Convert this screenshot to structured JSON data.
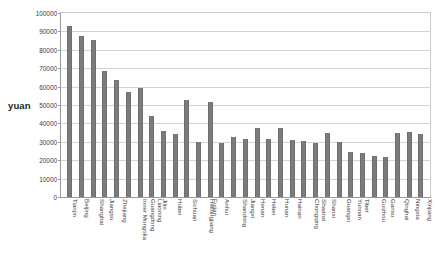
{
  "axis": {
    "y_unit_label": "yuan"
  },
  "chart_data": {
    "type": "bar",
    "title": "",
    "subtitle": "",
    "xlabel": "",
    "ylabel": "yuan",
    "ylim": [
      0,
      100000
    ],
    "ytick_labels": [
      "100000",
      "90000",
      "80000",
      "70000",
      "60000",
      "50000",
      "40000",
      "30000",
      "20000",
      "10000",
      "0"
    ],
    "ytick_values": [
      100000,
      90000,
      80000,
      70000,
      60000,
      50000,
      40000,
      30000,
      20000,
      10000,
      0
    ],
    "grid": true,
    "legend": "none",
    "bar_color": "#7b7b7b",
    "categories": [
      "Tianjin",
      "Beijing",
      "Shanghai",
      "Jiangsu",
      "Zhejiang",
      "Inner Mongolia",
      "Guangdong",
      "Liaoning",
      "Jilin",
      "Hubei",
      "Sichuan",
      "Heilongjiang",
      "Fujian",
      "Anhui",
      "Shandong",
      "Jiangxi",
      "Henan",
      "Hebei",
      "Hunan",
      "Hainan",
      "Chongqing",
      "Shaanxi",
      "Shanxi",
      "Guangxi",
      "Yunnan",
      "Tibet",
      "Guizhou",
      "Gansu",
      "Qinghai",
      "Ningxia",
      "Xinjiang"
    ],
    "values": [
      93000,
      87500,
      85500,
      68500,
      63500,
      57000,
      59000,
      44000,
      36000,
      34500,
      52500,
      30000,
      51500,
      29500,
      32500,
      31500,
      37500,
      31500,
      37500,
      31000,
      30500,
      29500,
      35000,
      30000,
      24500,
      24000,
      22500,
      21500,
      35000,
      35500,
      34000
    ]
  }
}
